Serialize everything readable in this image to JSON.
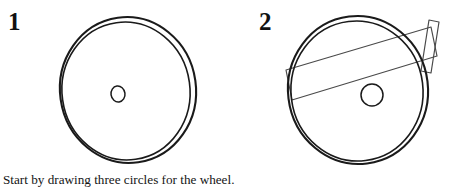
{
  "document": {
    "type": "drawing-tutorial",
    "title": "How to draw a cannon wheel",
    "background_color": "#ffffff",
    "ink_color": "#1a1a1a"
  },
  "steps": [
    {
      "number": "1",
      "caption": "Start by drawing three circles for the wheel.",
      "figure": {
        "name": "wheel-outline",
        "shapes": [
          {
            "name": "outer-rim-circle",
            "type": "ellipse",
            "cx": 128,
            "cy": 90,
            "rx": 68,
            "ry": 73,
            "rotation": -8,
            "stroke_width": 2.1
          },
          {
            "name": "inner-rim-circle",
            "type": "ellipse",
            "cx": 126,
            "cy": 91,
            "rx": 64,
            "ry": 69,
            "rotation": -8,
            "stroke_width": 1.6
          },
          {
            "name": "hub-circle",
            "type": "ellipse",
            "cx": 118,
            "cy": 94,
            "rx": 7,
            "ry": 8,
            "rotation": -8,
            "stroke_width": 1.5
          }
        ]
      }
    },
    {
      "number": "2",
      "caption": "Add two rectangles for the cannon.",
      "figure": {
        "name": "wheel-with-cannon-rectangles",
        "shapes": [
          {
            "name": "outer-rim-circle",
            "type": "ellipse",
            "cx": 132,
            "cy": 90,
            "rx": 70,
            "ry": 74,
            "rotation": -7,
            "stroke_width": 2.1
          },
          {
            "name": "inner-rim-circle",
            "type": "ellipse",
            "cx": 131,
            "cy": 91,
            "rx": 66,
            "ry": 70,
            "rotation": -7,
            "stroke_width": 1.6
          },
          {
            "name": "hub-circle",
            "type": "ellipse",
            "cx": 146,
            "cy": 95,
            "rx": 11,
            "ry": 11,
            "rotation": 0,
            "stroke_width": 1.5
          },
          {
            "name": "cannon-barrel-rectangle",
            "type": "rectangle",
            "stroke_width": 1.2,
            "corners": [
              [
                60,
                70
              ],
              [
                205,
                27
              ],
              [
                211,
                56
              ],
              [
                66,
                100
              ]
            ]
          },
          {
            "name": "cannon-muzzle-rectangle",
            "type": "rectangle",
            "stroke_width": 1.2,
            "corners": [
              [
                203,
                20
              ],
              [
                213,
                22
              ],
              [
                205,
                73
              ],
              [
                195,
                71
              ]
            ]
          }
        ]
      }
    }
  ]
}
